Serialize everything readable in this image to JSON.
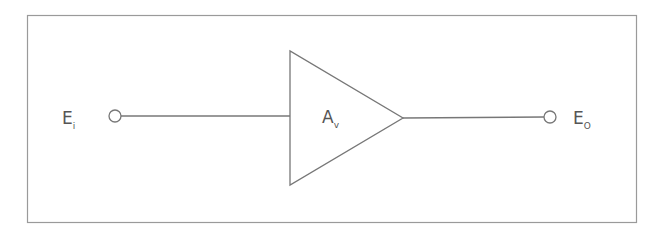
{
  "diagram": {
    "type": "amplifier-block-diagram",
    "input_label": {
      "main": "E",
      "sub": "i"
    },
    "amplifier_label": {
      "main": "A",
      "sub": "v"
    },
    "output_label": {
      "main": "E",
      "sub": "O"
    },
    "colors": {
      "stroke": "#777777",
      "text": "#555555",
      "frame": "#999999"
    }
  }
}
